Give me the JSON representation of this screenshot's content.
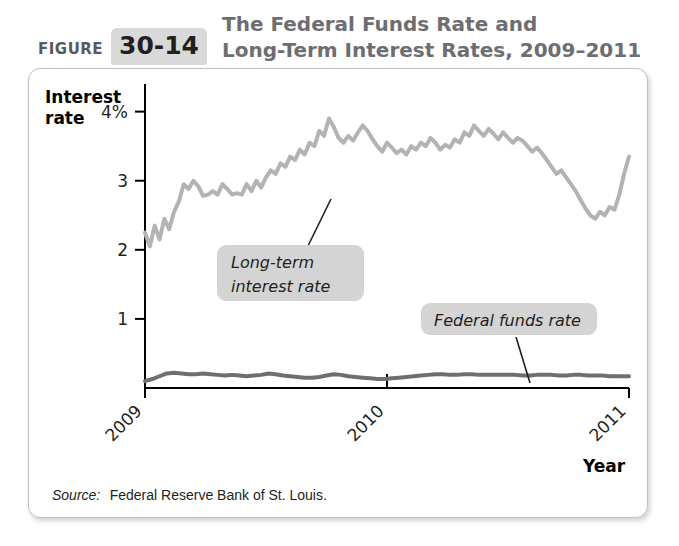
{
  "figure": {
    "label": "FIGURE",
    "number": "30-14",
    "title": "The Federal Funds Rate and\nLong-Term Interest Rates, 2009–2011",
    "source_prefix": "Source:",
    "source_text": "Federal Reserve Bank of St. Louis."
  },
  "colors": {
    "long_term_line": "#b3b3b3",
    "federal_funds_line": "#6e6e6e",
    "axis": "#000000",
    "callout_box": "#d4d4d4",
    "badge": "#d9d9d9",
    "title_text": "#6d6e71",
    "panel_border": "#bfbfbf"
  },
  "chart_data": {
    "type": "line",
    "title": "The Federal Funds Rate and Long-Term Interest Rates, 2009–2011",
    "xlabel": "Year",
    "ylabel": "Interest rate",
    "ylim": [
      0,
      4.4
    ],
    "xlim": [
      2009,
      2011
    ],
    "grid": false,
    "legend_position": "inline-callouts",
    "ytick_labels": [
      "1",
      "2",
      "3",
      "4%"
    ],
    "ytick_values": [
      1,
      2,
      3,
      4
    ],
    "xtick_labels": [
      "2009",
      "2010",
      "2011"
    ],
    "xtick_values": [
      2009,
      2010,
      2011
    ],
    "series": [
      {
        "name": "Long-term interest rate",
        "callout": "Long-term\ninterest rate",
        "color": "#b3b3b3",
        "x": [
          2009.0,
          2009.02,
          2009.04,
          2009.06,
          2009.08,
          2009.1,
          2009.12,
          2009.14,
          2009.16,
          2009.18,
          2009.2,
          2009.22,
          2009.24,
          2009.26,
          2009.28,
          2009.3,
          2009.32,
          2009.34,
          2009.36,
          2009.38,
          2009.4,
          2009.42,
          2009.44,
          2009.46,
          2009.48,
          2009.5,
          2009.52,
          2009.54,
          2009.56,
          2009.58,
          2009.6,
          2009.62,
          2009.64,
          2009.66,
          2009.68,
          2009.7,
          2009.72,
          2009.74,
          2009.76,
          2009.78,
          2009.8,
          2009.82,
          2009.84,
          2009.86,
          2009.88,
          2009.9,
          2009.92,
          2009.94,
          2009.96,
          2009.98,
          2010.0,
          2010.02,
          2010.04,
          2010.06,
          2010.08,
          2010.1,
          2010.12,
          2010.14,
          2010.16,
          2010.18,
          2010.2,
          2010.22,
          2010.24,
          2010.26,
          2010.28,
          2010.3,
          2010.32,
          2010.34,
          2010.36,
          2010.38,
          2010.4,
          2010.42,
          2010.44,
          2010.46,
          2010.48,
          2010.5,
          2010.52,
          2010.54,
          2010.56,
          2010.58,
          2010.6,
          2010.62,
          2010.64,
          2010.66,
          2010.68,
          2010.7,
          2010.72,
          2010.74,
          2010.76,
          2010.78,
          2010.8,
          2010.82,
          2010.84,
          2010.86,
          2010.88,
          2010.9,
          2010.92,
          2010.94,
          2010.96,
          2010.98,
          2011.0
        ],
        "y": [
          2.25,
          2.05,
          2.35,
          2.15,
          2.45,
          2.3,
          2.55,
          2.7,
          2.95,
          2.88,
          3.0,
          2.92,
          2.78,
          2.8,
          2.85,
          2.8,
          2.95,
          2.88,
          2.8,
          2.82,
          2.8,
          2.95,
          2.85,
          3.0,
          2.9,
          3.05,
          3.15,
          3.1,
          3.25,
          3.2,
          3.35,
          3.3,
          3.45,
          3.38,
          3.55,
          3.5,
          3.72,
          3.65,
          3.9,
          3.78,
          3.62,
          3.55,
          3.65,
          3.58,
          3.7,
          3.8,
          3.72,
          3.6,
          3.5,
          3.42,
          3.55,
          3.48,
          3.4,
          3.45,
          3.38,
          3.5,
          3.45,
          3.55,
          3.5,
          3.62,
          3.55,
          3.45,
          3.52,
          3.48,
          3.6,
          3.55,
          3.7,
          3.65,
          3.8,
          3.72,
          3.65,
          3.75,
          3.68,
          3.6,
          3.7,
          3.62,
          3.55,
          3.62,
          3.58,
          3.5,
          3.42,
          3.48,
          3.4,
          3.3,
          3.2,
          3.1,
          3.15,
          3.05,
          2.95,
          2.85,
          2.72,
          2.6,
          2.5,
          2.45,
          2.55,
          2.5,
          2.62,
          2.58,
          2.8,
          3.1,
          3.35
        ]
      },
      {
        "name": "Federal funds rate",
        "callout": "Federal funds rate",
        "color": "#6e6e6e",
        "x": [
          2009.0,
          2009.03,
          2009.06,
          2009.09,
          2009.12,
          2009.15,
          2009.18,
          2009.21,
          2009.24,
          2009.27,
          2009.3,
          2009.33,
          2009.36,
          2009.39,
          2009.42,
          2009.45,
          2009.48,
          2009.51,
          2009.54,
          2009.57,
          2009.6,
          2009.63,
          2009.66,
          2009.69,
          2009.72,
          2009.75,
          2009.78,
          2009.81,
          2009.84,
          2009.87,
          2009.9,
          2009.93,
          2009.96,
          2009.99,
          2010.02,
          2010.05,
          2010.08,
          2010.11,
          2010.14,
          2010.17,
          2010.2,
          2010.23,
          2010.26,
          2010.29,
          2010.32,
          2010.35,
          2010.38,
          2010.41,
          2010.44,
          2010.47,
          2010.5,
          2010.53,
          2010.56,
          2010.59,
          2010.62,
          2010.65,
          2010.68,
          2010.71,
          2010.74,
          2010.77,
          2010.8,
          2010.83,
          2010.86,
          2010.89,
          2010.92,
          2010.95,
          2010.98,
          2011.0
        ],
        "y": [
          0.1,
          0.13,
          0.17,
          0.21,
          0.22,
          0.21,
          0.2,
          0.2,
          0.21,
          0.2,
          0.19,
          0.18,
          0.19,
          0.18,
          0.17,
          0.18,
          0.19,
          0.21,
          0.2,
          0.18,
          0.17,
          0.16,
          0.15,
          0.15,
          0.16,
          0.18,
          0.2,
          0.19,
          0.17,
          0.16,
          0.15,
          0.14,
          0.13,
          0.13,
          0.14,
          0.15,
          0.16,
          0.17,
          0.18,
          0.19,
          0.2,
          0.2,
          0.19,
          0.19,
          0.2,
          0.2,
          0.19,
          0.19,
          0.19,
          0.19,
          0.19,
          0.19,
          0.18,
          0.18,
          0.19,
          0.19,
          0.19,
          0.18,
          0.18,
          0.19,
          0.19,
          0.18,
          0.18,
          0.18,
          0.17,
          0.17,
          0.17,
          0.17
        ]
      }
    ]
  }
}
